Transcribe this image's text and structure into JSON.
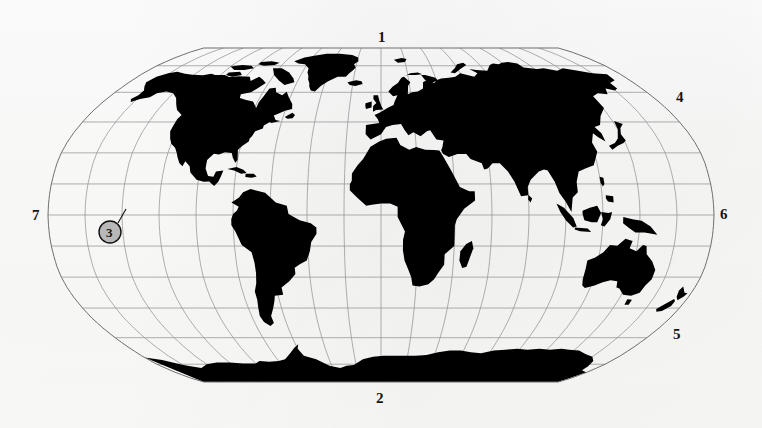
{
  "figure": {
    "kind": "world-map",
    "projection": "elliptical pseudo-cylindrical (Robinson-style) world map",
    "style": "scanned black-and-white line figure with solid black landmasses",
    "background_color": "#fdfdfd",
    "land_color": "#000000",
    "graticule_color": "#8d8d8d",
    "outline_color": "#6f6f6f",
    "label_color": "#151515"
  },
  "graticule": {
    "parallel_interval_degrees": 15,
    "meridian_interval_degrees": 20,
    "lat_min": -90,
    "lat_max": 90,
    "lon_min": -180,
    "lon_max": 180
  },
  "labels": [
    {
      "id": "label-1",
      "text": "1",
      "x": 378,
      "y": 30,
      "position": "top-center"
    },
    {
      "id": "label-2",
      "text": "2",
      "x": 376,
      "y": 391,
      "position": "bottom-center"
    },
    {
      "id": "label-4",
      "text": "4",
      "x": 676,
      "y": 90,
      "position": "upper-right"
    },
    {
      "id": "label-5",
      "text": "5",
      "x": 673,
      "y": 327,
      "position": "lower-right"
    },
    {
      "id": "label-6",
      "text": "6",
      "x": 720,
      "y": 207,
      "position": "right-edge"
    },
    {
      "id": "label-7",
      "text": "7",
      "x": 32,
      "y": 208,
      "position": "left-edge"
    }
  ],
  "callout": {
    "id": "callout-3",
    "text": "3",
    "circle_center_x": 110,
    "circle_center_y": 232,
    "circle_radius": 11,
    "circle_fill": "#b8b8b8",
    "circle_stroke": "#111111",
    "leader_from_x": 118,
    "leader_from_y": 223,
    "leader_to_x": 126,
    "leader_to_y": 209,
    "region": "eastern Pacific Ocean"
  },
  "map_frame": {
    "center_x": 381,
    "center_y": 215,
    "half_width": 333,
    "half_height": 167
  }
}
